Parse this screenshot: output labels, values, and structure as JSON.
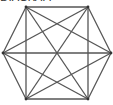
{
  "caption": "DIAGRAM",
  "diagram": {
    "type": "complete-graph-hexagon",
    "stroke": "#555555",
    "vertices": [
      {
        "id": "A",
        "x": 26,
        "y": 7
      },
      {
        "id": "B",
        "x": 88,
        "y": 7
      },
      {
        "id": "C",
        "x": 111,
        "y": 53
      },
      {
        "id": "D",
        "x": 88,
        "y": 99
      },
      {
        "id": "E",
        "x": 26,
        "y": 99
      },
      {
        "id": "F",
        "x": 3,
        "y": 53
      }
    ],
    "edges": [
      [
        "A",
        "B"
      ],
      [
        "B",
        "C"
      ],
      [
        "C",
        "D"
      ],
      [
        "D",
        "E"
      ],
      [
        "E",
        "F"
      ],
      [
        "F",
        "A"
      ],
      [
        "A",
        "C"
      ],
      [
        "A",
        "D"
      ],
      [
        "A",
        "E"
      ],
      [
        "B",
        "D"
      ],
      [
        "B",
        "E"
      ],
      [
        "B",
        "F"
      ],
      [
        "C",
        "E"
      ],
      [
        "C",
        "F"
      ],
      [
        "D",
        "F"
      ]
    ]
  }
}
